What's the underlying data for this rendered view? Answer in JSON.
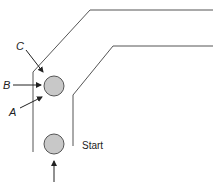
{
  "diagram": {
    "labels": {
      "c": "C",
      "b": "B",
      "a": "A",
      "start": "Start"
    },
    "colors": {
      "wall": "#555555",
      "ball_fill": "#c8c8c8",
      "text": "#222222"
    }
  }
}
